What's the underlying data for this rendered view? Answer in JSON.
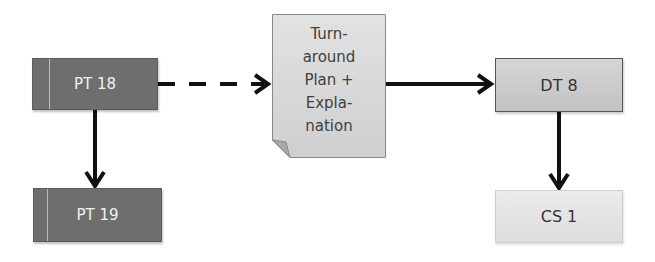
{
  "diagram": {
    "nodes": {
      "pt18": {
        "label": "PT 18"
      },
      "pt19": {
        "label": "PT 19"
      },
      "turnaround": {
        "label": "Turn-\naround\nPlan +\nExpla-\nnation"
      },
      "dt8": {
        "label": "DT 8"
      },
      "cs1": {
        "label": "CS 1"
      }
    },
    "edges": [
      {
        "from": "PT 18",
        "to": "Turnaround Plan + Explanation",
        "style": "dashed"
      },
      {
        "from": "Turnaround Plan + Explanation",
        "to": "DT 8",
        "style": "solid"
      },
      {
        "from": "PT 18",
        "to": "PT 19",
        "style": "solid"
      },
      {
        "from": "DT 8",
        "to": "CS 1",
        "style": "solid"
      }
    ],
    "colors": {
      "dark_node": "#6e6e6e",
      "mid_node": "#cccccc",
      "light_node": "#e4e4e4",
      "arrow": "#111111"
    }
  }
}
